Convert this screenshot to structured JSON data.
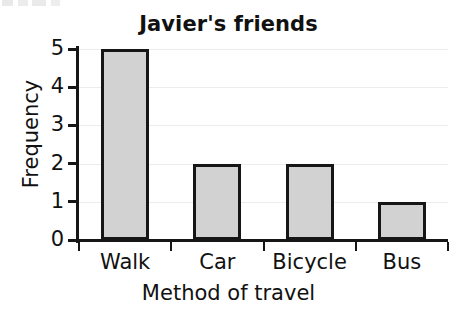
{
  "chart_data": {
    "type": "bar",
    "title": "Javier's friends",
    "xlabel": "Method of travel",
    "ylabel": "Frequency",
    "categories": [
      "Walk",
      "Car",
      "Bicycle",
      "Bus"
    ],
    "values": [
      5,
      2,
      2,
      1
    ],
    "ytick_labels": [
      "0",
      "1",
      "2",
      "3",
      "4",
      "5"
    ],
    "ytick_values": [
      0,
      1,
      2,
      3,
      4,
      5
    ],
    "ylim": [
      0,
      5
    ],
    "grid": "horizontal",
    "legend": "none",
    "bar_fill_color": "#d2d2d2",
    "bar_edge_color": "#161616",
    "gridline_color": "#ececec",
    "axis_color": "#161616",
    "background_color": "#ffffff"
  }
}
